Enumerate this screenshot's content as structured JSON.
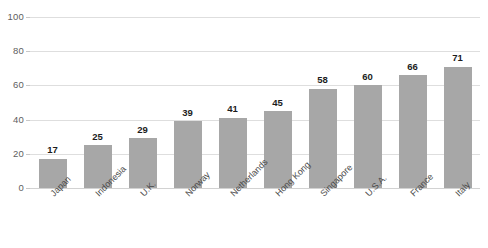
{
  "chart_data": {
    "type": "bar",
    "title": "",
    "subtitle": "",
    "xlabel": "",
    "ylabel": "",
    "categories": [
      "Japan",
      "Indonesia",
      "U.K.",
      "Norway",
      "Netherlands",
      "Hong Kong",
      "Singapore",
      "U.S.A.",
      "France",
      "Italy"
    ],
    "values": [
      17,
      25,
      29,
      39,
      41,
      45,
      58,
      60,
      66,
      71
    ],
    "ylim": [
      0,
      100
    ],
    "yticks": [
      0,
      20,
      40,
      60,
      80,
      100
    ],
    "ytick_labels": [
      "0",
      "20",
      "40",
      "60",
      "80",
      "100"
    ],
    "grid": true,
    "grid_axis": "y",
    "legend": false,
    "legend_position": "none",
    "data_labels": true,
    "xtick_rotation": -45,
    "colors": {
      "bar_fill": "#a7a7a7",
      "gridline": "#dedede",
      "baseline": "#d2d2d2",
      "tick_text": "#5e5e5e",
      "category_text": "#4a4a4a",
      "value_label_text": "#1c1c1c",
      "background": "#ffffff"
    }
  }
}
